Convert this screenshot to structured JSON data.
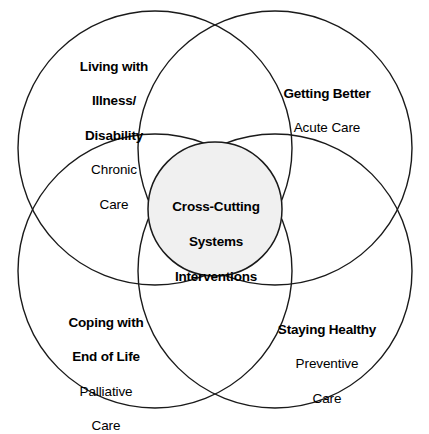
{
  "diagram": {
    "type": "venn",
    "caption": "Four overlapping circles representing domains of care with a shaded central intersection",
    "stroke_color": "#1a1a1a",
    "center_fill_color": "#f0f0f0",
    "background_color": "#ffffff",
    "center": {
      "title_line_1": "Cross-Cutting",
      "title_line_2": "Systems",
      "title_line_3": "Interventions"
    },
    "regions": [
      {
        "id": "living-with-illness",
        "position": "top-left",
        "title_line_1": "Living with",
        "title_line_2": "Illness/",
        "title_line_3": "Disability",
        "subtitle_line_1": "Chronic",
        "subtitle_line_2": "Care"
      },
      {
        "id": "getting-better",
        "position": "top-right",
        "title_line_1": "Getting Better",
        "subtitle_line_1": "Acute Care"
      },
      {
        "id": "coping-end-of-life",
        "position": "bottom-left",
        "title_line_1": "Coping with",
        "title_line_2": "End of Life",
        "subtitle_line_1": "Palliative",
        "subtitle_line_2": "Care"
      },
      {
        "id": "staying-healthy",
        "position": "bottom-right",
        "title_line_1": "Staying Healthy",
        "subtitle_line_1": "Preventive",
        "subtitle_line_2": "Care"
      }
    ]
  }
}
